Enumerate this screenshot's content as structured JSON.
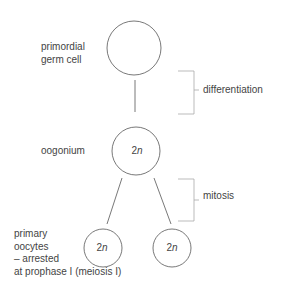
{
  "labels": {
    "primordial": [
      "primordial",
      "germ cell"
    ],
    "oogonium": "oogonium",
    "primary_oocytes": [
      "primary",
      "oocytes",
      "– arrested",
      "at prophase I (meiosis I)"
    ],
    "differentiation": "differentiation",
    "mitosis": "mitosis"
  },
  "ploidy": {
    "oogonium": {
      "num": "2",
      "var": "n"
    },
    "oocyte_left": {
      "num": "2",
      "var": "n"
    },
    "oocyte_right": {
      "num": "2",
      "var": "n"
    }
  },
  "colors": {
    "stroke": "#555555",
    "bracket": "#aaaaaa",
    "text": "#444444"
  }
}
